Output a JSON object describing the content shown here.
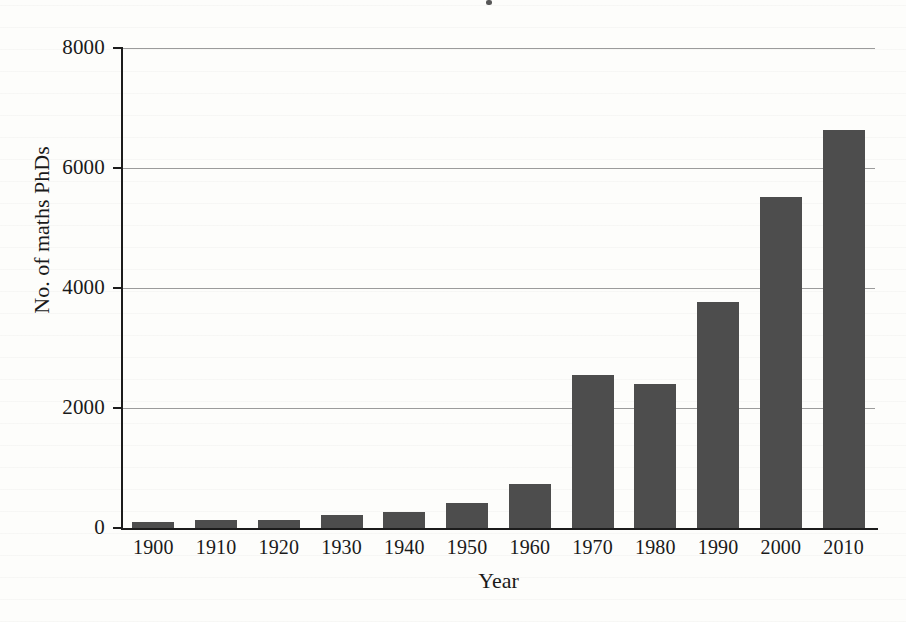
{
  "chart_data": {
    "type": "bar",
    "title": "",
    "xlabel": "Year",
    "ylabel": "No. of maths PhDs",
    "categories": [
      "1900",
      "1910",
      "1920",
      "1930",
      "1940",
      "1950",
      "1960",
      "1970",
      "1980",
      "1990",
      "2000",
      "2010"
    ],
    "values": [
      100,
      130,
      130,
      210,
      260,
      420,
      740,
      2550,
      2400,
      3760,
      5520,
      6630
    ],
    "ylim": [
      0,
      8000
    ],
    "yticks": [
      0,
      2000,
      4000,
      6000,
      8000
    ],
    "ytick_labels": [
      "0",
      "2000",
      "4000",
      "6000",
      "8000"
    ],
    "xtick_labels": [
      "1900",
      "1910",
      "1920",
      "1930",
      "1940",
      "1950",
      "1960",
      "1970",
      "1980",
      "1990",
      "2000",
      "2010"
    ],
    "grid": "horizontal",
    "legend": "none",
    "bar_color": "#4d4d4d",
    "axis_color": "#1c1c1c",
    "gridline_color": "#9b9b9b",
    "background_color": "#fdfdfb"
  }
}
